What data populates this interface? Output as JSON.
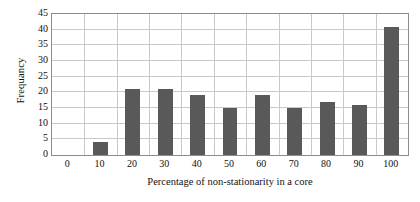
{
  "chart_data": {
    "type": "bar",
    "title": "",
    "xlabel": "Percentage of non-stationarity in a core",
    "ylabel": "Frequancy",
    "categories": [
      "0",
      "10",
      "20",
      "30",
      "40",
      "50",
      "60",
      "70",
      "80",
      "90",
      "100"
    ],
    "values": [
      0,
      4,
      21,
      21,
      19,
      15,
      19,
      15,
      17,
      16,
      41
    ],
    "xtick_labels": [
      "0",
      "10",
      "20",
      "30",
      "40",
      "50",
      "60",
      "70",
      "80",
      "90",
      "100"
    ],
    "ytick_labels": [
      "0",
      "5",
      "10",
      "15",
      "20",
      "25",
      "30",
      "35",
      "40",
      "45"
    ],
    "ytick_values": [
      0,
      5,
      10,
      15,
      20,
      25,
      30,
      35,
      40,
      45
    ],
    "ylim": [
      0,
      45
    ],
    "grid": "horizontal-and-vertical",
    "legend": "none",
    "bar_color": "#595959",
    "grid_color": "#c9c9c9",
    "axis_color": "#8d8d8d",
    "background_color": "#ffffff"
  }
}
